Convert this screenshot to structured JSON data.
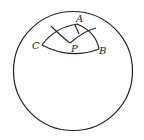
{
  "diagram": {
    "type": "spherical-triangle-on-sphere",
    "colors": {
      "stroke": "#222222",
      "background": "#ffffff"
    },
    "labels": {
      "A": "A",
      "B": "B",
      "C": "C",
      "P": "P"
    }
  }
}
